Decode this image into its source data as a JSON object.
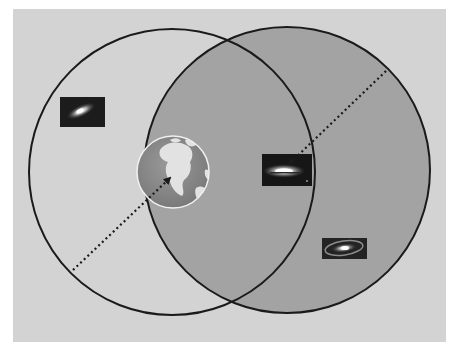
{
  "canvas": {
    "width": 457,
    "height": 351,
    "page_bg": "#ffffff"
  },
  "panel": {
    "x": 13,
    "y": 9,
    "width": 433,
    "height": 333,
    "fill": "#d3d3d3"
  },
  "circles": [
    {
      "id": "left-circle",
      "cx": 172,
      "cy": 172,
      "r": 143,
      "fill": "#d3d3d3",
      "stroke": "#1a1a1a",
      "stroke_width": 2
    },
    {
      "id": "right-circle",
      "cx": 287,
      "cy": 170,
      "r": 143,
      "fill": "#a3a3a3",
      "stroke": "#1a1a1a",
      "stroke_width": 2
    }
  ],
  "earth": {
    "cx": 173,
    "cy": 172,
    "r": 36,
    "ocean": "#8a8a8a",
    "land": "#e2e2e2",
    "rim": "#f0f0f0"
  },
  "galaxies": [
    {
      "id": "galaxy-top-left",
      "x": 60,
      "y": 97,
      "width": 45,
      "height": 30
    },
    {
      "id": "galaxy-center",
      "x": 262,
      "y": 154,
      "width": 50,
      "height": 32
    },
    {
      "id": "galaxy-bottom-right",
      "x": 322,
      "y": 238,
      "width": 45,
      "height": 21
    }
  ],
  "arrows": [
    {
      "id": "arrow-to-earth",
      "x1": 73,
      "y1": 270,
      "x2": 172,
      "y2": 176
    },
    {
      "id": "arrow-to-galaxy",
      "x1": 386,
      "y1": 71,
      "x2": 287,
      "y2": 166
    }
  ],
  "line_color": "#1a1a1a"
}
